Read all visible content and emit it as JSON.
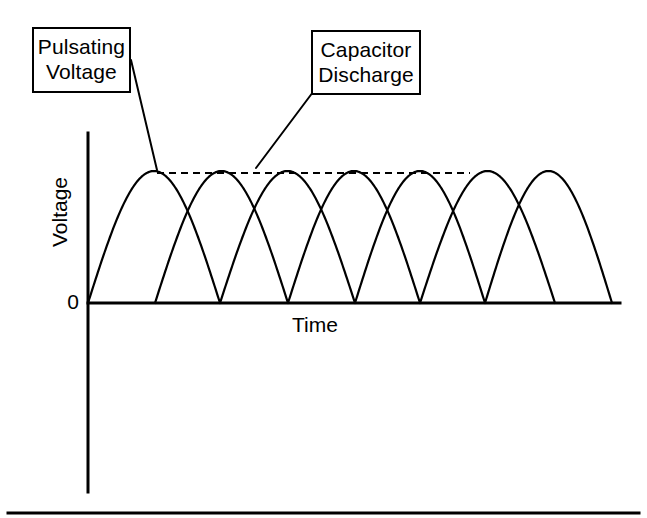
{
  "figure": {
    "background_color": "#ffffff",
    "stroke_color": "#000000",
    "callouts": [
      {
        "name": "pulsating-voltage",
        "line1": "Pulsating",
        "line2": "Voltage",
        "box": {
          "x": 32,
          "y": 27,
          "width": 99,
          "height": 66
        },
        "leader": {
          "x1": 131,
          "y1": 60,
          "x2": 157,
          "y2": 170
        }
      },
      {
        "name": "capacitor-discharge",
        "line1": "Capacitor",
        "line2": "Discharge",
        "box": {
          "x": 311,
          "y": 30,
          "width": 110,
          "height": 65
        },
        "leader": {
          "x1": 313,
          "y1": 92,
          "x2": 256,
          "y2": 168
        }
      }
    ],
    "axes": {
      "y_title": "Voltage",
      "x_title": "Time",
      "origin_label": "0",
      "y_axis": {
        "x": 88,
        "y_top": 133,
        "y_bottom": 492
      },
      "x_axis": {
        "y": 303,
        "x_left": 88,
        "x_right": 620
      }
    },
    "peak_line": {
      "name": "peak-voltage-dashed-line",
      "y": 173,
      "x_start": 157,
      "x_end": 470,
      "dash": "7 5"
    },
    "footer_rule": {
      "y": 513,
      "x_start": 8,
      "x_end": 639
    }
  },
  "chart_data": {
    "type": "line",
    "title": "",
    "xlabel": "Time",
    "ylabel": "Voltage",
    "annotations": [
      "Pulsating Voltage",
      "Capacitor Discharge"
    ],
    "grid": false,
    "legend": "none",
    "xlim": [
      88,
      620
    ],
    "ylim": [
      303,
      171
    ],
    "baseline_y": 303,
    "peak_y": 171,
    "zero_crossings": [
      88,
      155,
      220,
      288,
      355,
      420,
      485,
      555
    ],
    "arch_period_px": 67,
    "series": [
      {
        "name": "half-cycle-arch-1",
        "x_start": 88,
        "x_end": 220,
        "peak_x": 154,
        "peak_y": 171
      },
      {
        "name": "half-cycle-arch-2",
        "x_start": 155,
        "x_end": 288,
        "peak_x": 221,
        "peak_y": 171
      },
      {
        "name": "half-cycle-arch-3",
        "x_start": 220,
        "x_end": 355,
        "peak_x": 288,
        "peak_y": 171
      },
      {
        "name": "half-cycle-arch-4",
        "x_start": 288,
        "x_end": 420,
        "peak_x": 354,
        "peak_y": 171
      },
      {
        "name": "half-cycle-arch-5",
        "x_start": 355,
        "x_end": 485,
        "peak_x": 420,
        "peak_y": 171
      },
      {
        "name": "half-cycle-arch-6",
        "x_start": 420,
        "x_end": 555,
        "peak_x": 470,
        "peak_y": 171
      },
      {
        "name": "half-cycle-arch-7",
        "x_start": 485,
        "x_end": 612,
        "peak_x": 549,
        "peak_y": 171
      }
    ]
  }
}
